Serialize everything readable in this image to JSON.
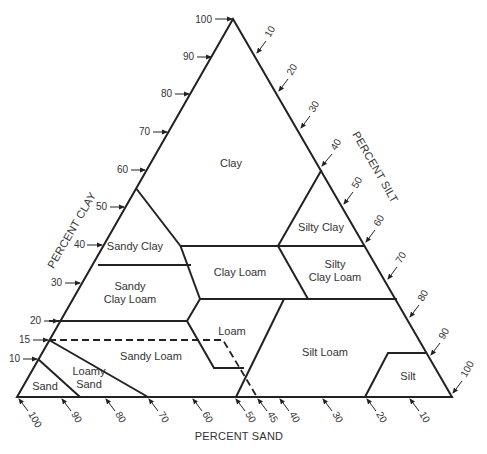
{
  "diagram": {
    "type": "soil-texture-triangle",
    "axes": {
      "clay": {
        "title": "PERCENT CLAY",
        "ticks": [
          "100",
          "90",
          "80",
          "70",
          "60",
          "50",
          "40",
          "30",
          "20",
          "15",
          "10"
        ]
      },
      "silt": {
        "title": "PERCENT SILT",
        "ticks": [
          "10",
          "20",
          "30",
          "40",
          "50",
          "60",
          "70",
          "80",
          "90",
          "100"
        ]
      },
      "sand": {
        "title": "PERCENT SAND",
        "ticks": [
          "100",
          "90",
          "80",
          "70",
          "60",
          "50",
          "45",
          "40",
          "30",
          "20",
          "10"
        ]
      }
    },
    "regions": [
      {
        "id": "clay",
        "label": "Clay"
      },
      {
        "id": "sandy-clay",
        "label": "Sandy Clay"
      },
      {
        "id": "silty-clay",
        "label": "Silty Clay"
      },
      {
        "id": "sandy-clay-loam",
        "label_line1": "Sandy",
        "label_line2": "Clay Loam"
      },
      {
        "id": "clay-loam",
        "label": "Clay Loam"
      },
      {
        "id": "silty-clay-loam",
        "label_line1": "Silty",
        "label_line2": "Clay Loam"
      },
      {
        "id": "loam",
        "label": "Loam"
      },
      {
        "id": "sandy-loam",
        "label": "Sandy Loam"
      },
      {
        "id": "silt-loam",
        "label": "Silt Loam"
      },
      {
        "id": "loamy-sand",
        "label_line1": "Loamy",
        "label_line2": "Sand"
      },
      {
        "id": "sand",
        "label": "Sand"
      },
      {
        "id": "silt",
        "label": "Silt"
      }
    ],
    "colors": {
      "line": "#222222",
      "text": "#333333",
      "background": "#ffffff"
    }
  }
}
